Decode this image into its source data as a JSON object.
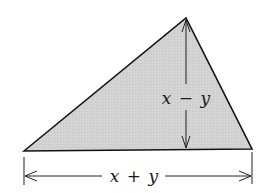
{
  "diagram": {
    "type": "triangle",
    "fill_color": "#d4d4d4",
    "stroke_color": "#111111",
    "vertices": {
      "left": [
        24,
        151
      ],
      "apex": [
        186,
        18
      ],
      "right": [
        252,
        149
      ]
    },
    "height_label": {
      "var1": "x",
      "op": "−",
      "var2": "y",
      "text": "x − y"
    },
    "base_label": {
      "var1": "x",
      "op": "+",
      "var2": "y",
      "text": "x + y"
    }
  }
}
